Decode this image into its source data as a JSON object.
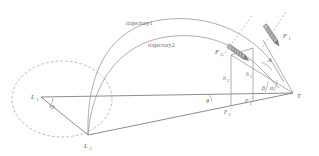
{
  "figure": {
    "kind": "ballistic-trajectory-geometry-diagram",
    "background_color": "#ffffff",
    "line_color": "#8d8d8d",
    "label_color": "#5b5b5b",
    "projectile_color": "#b9b9b9"
  },
  "curve_labels": {
    "trajectory1": "trajectory1",
    "trajectory2": "trajectory2"
  },
  "points": {
    "launcher_upper": "L",
    "launcher_upper_sub": "1",
    "launcher_lower": "L",
    "launcher_lower_sub": "2",
    "origin_angle": "O",
    "target": "T"
  },
  "forces": {
    "f1": "F",
    "f1_sub": "1",
    "f2": "F",
    "f2_sub": "2",
    "f1_proj": "F",
    "f1_proj_sub": "1",
    "f1_proj_prime": "'",
    "f2_proj": "F",
    "f2_proj_sub": "2",
    "f2_proj_prime": "'"
  },
  "heights": {
    "h2": "h",
    "h2_sub": "2",
    "h1": "h",
    "h1_sub": "1"
  },
  "angles": {
    "big_a": "A",
    "beta": "β",
    "alpha": "α",
    "theta": "θ",
    "o": "O"
  }
}
